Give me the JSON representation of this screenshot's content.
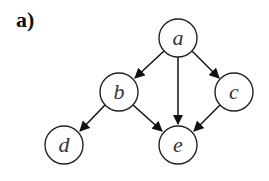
{
  "figure": {
    "panel_label": "a)",
    "graph_type": "directed acyclic graph",
    "colors": {
      "stroke": "#222222",
      "background": "#ffffff",
      "text": "#333333"
    },
    "nodes": [
      {
        "id": "a",
        "label": "a",
        "x": 178,
        "y": 38
      },
      {
        "id": "b",
        "label": "b",
        "x": 119,
        "y": 92
      },
      {
        "id": "c",
        "label": "c",
        "x": 234,
        "y": 92
      },
      {
        "id": "d",
        "label": "d",
        "x": 64,
        "y": 145
      },
      {
        "id": "e",
        "label": "e",
        "x": 178,
        "y": 145
      }
    ],
    "edges": [
      {
        "from": "a",
        "to": "b"
      },
      {
        "from": "a",
        "to": "e"
      },
      {
        "from": "a",
        "to": "c"
      },
      {
        "from": "b",
        "to": "d"
      },
      {
        "from": "b",
        "to": "e"
      },
      {
        "from": "c",
        "to": "e"
      }
    ]
  }
}
